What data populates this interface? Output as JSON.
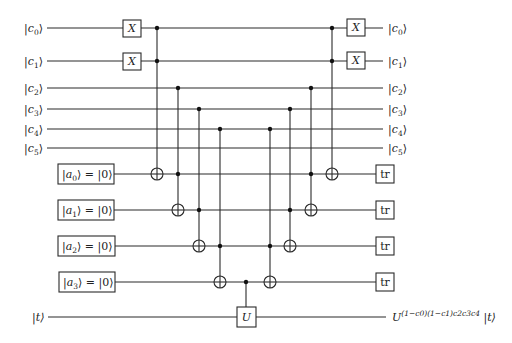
{
  "diagram": {
    "type": "quantum-circuit",
    "control_qubits": [
      {
        "name": "c",
        "sub": "0",
        "in_label": "|c0⟩",
        "out_label": "|c0⟩"
      },
      {
        "name": "c",
        "sub": "1",
        "in_label": "|c1⟩",
        "out_label": "|c1⟩"
      },
      {
        "name": "c",
        "sub": "2",
        "in_label": "|c2⟩",
        "out_label": "|c2⟩"
      },
      {
        "name": "c",
        "sub": "3",
        "in_label": "|c3⟩",
        "out_label": "|c3⟩"
      },
      {
        "name": "c",
        "sub": "4",
        "in_label": "|c4⟩",
        "out_label": "|c4⟩"
      },
      {
        "name": "c",
        "sub": "5",
        "in_label": "|c5⟩",
        "out_label": "|c5⟩"
      }
    ],
    "ancilla_qubits": [
      {
        "name": "a",
        "sub": "0",
        "init": "|0⟩",
        "label": "|a0⟩ = |0⟩",
        "end_gate": "tr"
      },
      {
        "name": "a",
        "sub": "1",
        "init": "|0⟩",
        "label": "|a1⟩ = |0⟩",
        "end_gate": "tr"
      },
      {
        "name": "a",
        "sub": "2",
        "init": "|0⟩",
        "label": "|a2⟩ = |0⟩",
        "end_gate": "tr"
      },
      {
        "name": "a",
        "sub": "3",
        "init": "|0⟩",
        "label": "|a3⟩ = |0⟩",
        "end_gate": "tr"
      }
    ],
    "target_qubit": {
      "in_label": "|t⟩",
      "out_label": "U^((1−c0)(1−c1)c2c3c4) |t⟩",
      "out_base": "U",
      "out_exponent": "(1−c0)(1−c1)c2c3c4",
      "out_ket": "|t⟩"
    },
    "gates": {
      "x_label": "X",
      "u_label": "U",
      "trace_label": "tr"
    },
    "operations": [
      {
        "step": 1,
        "type": "X",
        "targets": [
          "c0",
          "c1"
        ]
      },
      {
        "step": 2,
        "type": "Toffoli",
        "controls": [
          "c0",
          "c1"
        ],
        "target": "a0"
      },
      {
        "step": 3,
        "type": "Toffoli",
        "controls": [
          "c2",
          "a0"
        ],
        "target": "a1"
      },
      {
        "step": 4,
        "type": "Toffoli",
        "controls": [
          "c3",
          "a1"
        ],
        "target": "a2"
      },
      {
        "step": 5,
        "type": "Toffoli",
        "controls": [
          "c4",
          "a2"
        ],
        "target": "a3"
      },
      {
        "step": 6,
        "type": "Controlled-U",
        "controls": [
          "a3"
        ],
        "target": "t"
      },
      {
        "step": 7,
        "type": "Toffoli",
        "controls": [
          "c4",
          "a2"
        ],
        "target": "a3"
      },
      {
        "step": 8,
        "type": "Toffoli",
        "controls": [
          "c3",
          "a1"
        ],
        "target": "a2"
      },
      {
        "step": 9,
        "type": "Toffoli",
        "controls": [
          "c2",
          "a0"
        ],
        "target": "a1"
      },
      {
        "step": 10,
        "type": "Toffoli",
        "controls": [
          "c0",
          "c1"
        ],
        "target": "a0"
      },
      {
        "step": 11,
        "type": "X",
        "targets": [
          "c0",
          "c1"
        ]
      },
      {
        "step": 12,
        "type": "trace",
        "targets": [
          "a0",
          "a1",
          "a2",
          "a3"
        ]
      }
    ]
  }
}
